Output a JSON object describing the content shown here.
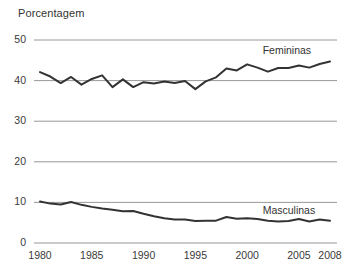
{
  "chart_data": {
    "type": "line",
    "title": "Porcentagem",
    "xlabel": "",
    "ylabel": "Porcentagem",
    "xlim": [
      1980,
      2008
    ],
    "ylim": [
      0,
      50
    ],
    "grid": true,
    "legend_position": "inline-right",
    "x": [
      1980,
      1981,
      1982,
      1983,
      1984,
      1985,
      1986,
      1987,
      1988,
      1989,
      1990,
      1991,
      1992,
      1993,
      1994,
      1995,
      1996,
      1997,
      1998,
      1999,
      2000,
      2001,
      2002,
      2003,
      2004,
      2005,
      2006,
      2007,
      2008
    ],
    "xticks": [
      1980,
      1985,
      1990,
      1995,
      2000,
      2005,
      2008
    ],
    "xtick_labels": [
      "1980",
      "1985",
      "1990",
      "1995",
      "2000",
      "2005",
      "2008"
    ],
    "yticks": [
      0,
      10,
      20,
      30,
      40,
      50
    ],
    "ytick_labels": [
      "0",
      "10",
      "20",
      "30",
      "40",
      "50"
    ],
    "series": [
      {
        "name": "Femininas",
        "color": "#333333",
        "label_x": 2001.5,
        "label_y": 47.2,
        "values": [
          42.1,
          41.0,
          39.4,
          40.9,
          39.0,
          40.4,
          41.3,
          38.4,
          40.3,
          38.4,
          39.6,
          39.3,
          39.8,
          39.4,
          39.9,
          37.9,
          39.8,
          40.8,
          43.0,
          42.5,
          44.0,
          43.2,
          42.2,
          43.1,
          43.1,
          43.7,
          43.2,
          44.1,
          44.7
        ]
      },
      {
        "name": "Masculinas",
        "color": "#333333",
        "label_x": 2001.5,
        "label_y": 7.9,
        "values": [
          10.2,
          9.7,
          9.5,
          10.1,
          9.4,
          8.9,
          8.5,
          8.2,
          7.8,
          7.9,
          7.2,
          6.6,
          6.1,
          5.8,
          5.8,
          5.4,
          5.5,
          5.5,
          6.4,
          6.0,
          6.1,
          5.9,
          5.5,
          5.3,
          5.4,
          5.9,
          5.3,
          5.8,
          5.5
        ]
      }
    ]
  }
}
